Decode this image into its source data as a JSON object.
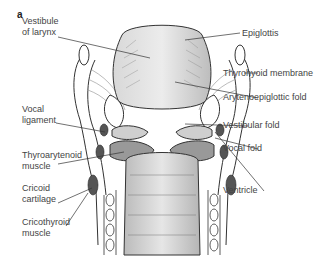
{
  "figure": {
    "panel_letter": "a"
  },
  "labels": {
    "left": [
      {
        "id": "vestibule",
        "lines": [
          "Vestibule",
          "of larynx"
        ]
      },
      {
        "id": "vocal-ligament",
        "lines": [
          "Vocal",
          "ligament"
        ]
      },
      {
        "id": "thyroarytenoid",
        "lines": [
          "Thyroarytenoid",
          "muscle"
        ]
      },
      {
        "id": "cricoid",
        "lines": [
          "Cricoid",
          "cartilage"
        ]
      },
      {
        "id": "cricothyroid",
        "lines": [
          "Cricothyroid",
          "muscle"
        ]
      }
    ],
    "right": [
      {
        "id": "epiglottis",
        "lines": [
          "Epiglottis"
        ]
      },
      {
        "id": "thyrohyoid",
        "lines": [
          "Thyrohyoid membrane"
        ]
      },
      {
        "id": "aryepiglottic",
        "lines": [
          "Arytenoepiglottic fold"
        ]
      },
      {
        "id": "vestibular",
        "lines": [
          "Vestibular fold"
        ]
      },
      {
        "id": "vocal-fold",
        "lines": [
          "Vocal fold"
        ]
      },
      {
        "id": "ventricle",
        "lines": [
          "Ventricle"
        ]
      }
    ]
  },
  "colors": {
    "line": "#333333",
    "fill_light": "#e4e4e4",
    "fill_mid": "#c8c8c8",
    "muscle": "#555555"
  }
}
